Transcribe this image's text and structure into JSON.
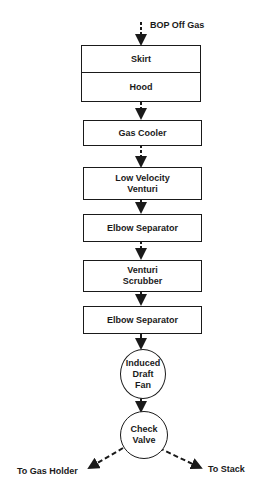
{
  "diagram": {
    "input_label": "BOP Off Gas",
    "nodes": [
      {
        "id": "skirt",
        "label": "Skirt",
        "shape": "box"
      },
      {
        "id": "hood",
        "label": "Hood",
        "shape": "box"
      },
      {
        "id": "gas-cooler",
        "label": "Gas Cooler",
        "shape": "box"
      },
      {
        "id": "low-velocity-venturi",
        "label": "Low Velocity\nVenturi",
        "shape": "box"
      },
      {
        "id": "elbow-separator-1",
        "label": "Elbow Separator",
        "shape": "box"
      },
      {
        "id": "venturi-scrubber",
        "label": "Venturi\nScrubber",
        "shape": "box"
      },
      {
        "id": "elbow-separator-2",
        "label": "Elbow Separator",
        "shape": "box"
      },
      {
        "id": "induced-draft-fan",
        "label": "Induced\nDraft\nFan",
        "shape": "circle"
      },
      {
        "id": "check-valve",
        "label": "Check\nValve",
        "shape": "circle"
      }
    ],
    "outputs": {
      "left": "To Gas Holder",
      "right": "To Stack"
    },
    "colors": {
      "line": "#1a1a1a",
      "background": "#ffffff"
    }
  }
}
